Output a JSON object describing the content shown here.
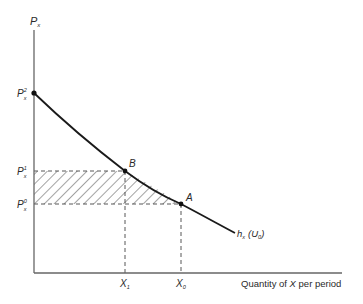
{
  "diagram": {
    "type": "compensated-demand-curve",
    "y_axis_label": "P",
    "y_axis_sub": "x",
    "x_axis_label_pre": "Quantity of ",
    "x_axis_label_var": "X",
    "x_axis_label_post": " per period",
    "price_labels": [
      {
        "base": "P",
        "sub": "x",
        "sup": "2"
      },
      {
        "base": "P",
        "sub": "x",
        "sup": "1"
      },
      {
        "base": "P",
        "sub": "x",
        "sup": "0"
      }
    ],
    "quantity_labels": [
      {
        "base": "X",
        "sub": "1"
      },
      {
        "base": "X",
        "sub": "0"
      }
    ],
    "points": [
      {
        "label": "B"
      },
      {
        "label": "A"
      }
    ],
    "curve_label": {
      "base": "h",
      "sub": "x",
      "arg_open": "(",
      "arg_base": "U",
      "arg_sub": "0",
      "arg_close": ")"
    },
    "colors": {
      "line": "#1a1a1a",
      "axis": "#555555",
      "hatch": "#333333"
    }
  }
}
